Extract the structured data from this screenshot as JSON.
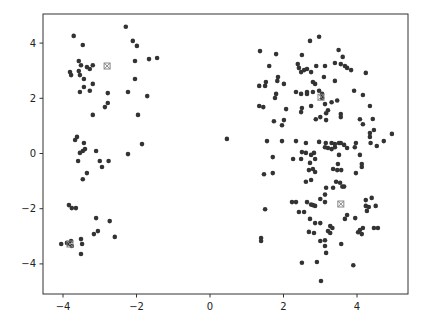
{
  "chart_data": {
    "type": "scatter",
    "title": "",
    "xlabel": "",
    "ylabel": "",
    "xlim": [
      -4.5,
      5.4
    ],
    "ylim": [
      -5.0,
      5.0
    ],
    "xticks": [
      -4,
      -2,
      0,
      2,
      4
    ],
    "yticks": [
      -4,
      -2,
      0,
      2,
      4
    ],
    "xtick_labels": [
      "−4",
      "−2",
      "0",
      "2",
      "4"
    ],
    "ytick_labels": [
      "−4",
      "−2",
      "0",
      "2",
      "4"
    ],
    "grid": false,
    "legend": null,
    "point_color": "#333333",
    "centroid_color": "#888888",
    "series": [
      {
        "name": "points",
        "marker": "circle",
        "points": [
          [
            -3.71,
            4.26
          ],
          [
            -3.46,
            3.93
          ],
          [
            -2.29,
            4.59
          ],
          [
            -2.1,
            4.08
          ],
          [
            -1.99,
            3.9
          ],
          [
            -3.57,
            3.35
          ],
          [
            -3.51,
            3.2
          ],
          [
            -3.35,
            3.13
          ],
          [
            -3.27,
            3.06
          ],
          [
            -3.19,
            3.2
          ],
          [
            -3.81,
            2.95
          ],
          [
            -3.78,
            2.84
          ],
          [
            -3.57,
            2.99
          ],
          [
            -3.54,
            2.84
          ],
          [
            -3.43,
            2.7
          ],
          [
            -3.19,
            2.52
          ],
          [
            -3.43,
            2.41
          ],
          [
            -3.54,
            2.23
          ],
          [
            -3.27,
            2.27
          ],
          [
            -2.04,
            3.35
          ],
          [
            -1.66,
            3.42
          ],
          [
            -1.44,
            3.46
          ],
          [
            -2.04,
            2.7
          ],
          [
            -2.78,
            2.19
          ],
          [
            -2.23,
            2.23
          ],
          [
            -1.71,
            2.08
          ],
          [
            -2.78,
            1.83
          ],
          [
            -2.86,
            1.68
          ],
          [
            -3.19,
            1.4
          ],
          [
            -1.96,
            1.4
          ],
          [
            -3.62,
            0.6
          ],
          [
            -3.67,
            0.49
          ],
          [
            -3.43,
            0.38
          ],
          [
            -3.4,
            0.16
          ],
          [
            -3.46,
            0.09
          ],
          [
            -3.54,
            0.02
          ],
          [
            -3.1,
            0.09
          ],
          [
            -2.23,
            -0.02
          ],
          [
            -1.85,
            0.34
          ],
          [
            -3.59,
            -0.27
          ],
          [
            -3.0,
            -0.27
          ],
          [
            -2.76,
            -0.27
          ],
          [
            -2.94,
            -0.49
          ],
          [
            -3.35,
            -0.71
          ],
          [
            -3.46,
            -0.93
          ],
          [
            -3.84,
            -1.87
          ],
          [
            -3.76,
            -1.98
          ],
          [
            -3.65,
            -1.98
          ],
          [
            -3.1,
            -2.34
          ],
          [
            -2.73,
            -2.45
          ],
          [
            -3.05,
            -2.81
          ],
          [
            -3.16,
            -2.92
          ],
          [
            -2.59,
            -3.02
          ],
          [
            -4.05,
            -3.28
          ],
          [
            -3.89,
            -3.24
          ],
          [
            -3.84,
            -3.28
          ],
          [
            -3.78,
            -3.17
          ],
          [
            -3.76,
            -3.35
          ],
          [
            -3.51,
            -3.1
          ],
          [
            -3.48,
            -3.28
          ],
          [
            -3.51,
            -3.64
          ],
          [
            2.72,
            4.08
          ],
          [
            2.97,
            4.23
          ],
          [
            1.36,
            3.71
          ],
          [
            1.8,
            3.6
          ],
          [
            2.5,
            3.57
          ],
          [
            3.5,
            3.75
          ],
          [
            3.61,
            3.5
          ],
          [
            1.61,
            3.17
          ],
          [
            2.39,
            3.24
          ],
          [
            2.42,
            3.1
          ],
          [
            2.48,
            2.95
          ],
          [
            2.56,
            3.02
          ],
          [
            2.64,
            3.06
          ],
          [
            2.75,
            2.95
          ],
          [
            2.89,
            3.17
          ],
          [
            3.13,
            3.17
          ],
          [
            3.4,
            3.28
          ],
          [
            3.56,
            3.24
          ],
          [
            3.67,
            3.17
          ],
          [
            3.73,
            3.1
          ],
          [
            3.84,
            3.02
          ],
          [
            4.24,
            2.92
          ],
          [
            1.85,
            2.77
          ],
          [
            1.83,
            2.63
          ],
          [
            1.52,
            2.59
          ],
          [
            1.34,
            2.45
          ],
          [
            1.5,
            2.45
          ],
          [
            2.01,
            2.52
          ],
          [
            2.8,
            2.59
          ],
          [
            2.86,
            2.52
          ],
          [
            3.1,
            2.77
          ],
          [
            3.4,
            2.63
          ],
          [
            2.64,
            2.23
          ],
          [
            3.92,
            2.27
          ],
          [
            4.16,
            2.12
          ],
          [
            1.8,
            2.16
          ],
          [
            1.77,
            2.01
          ],
          [
            2.34,
            2.23
          ],
          [
            2.48,
            2.16
          ],
          [
            2.64,
            2.16
          ],
          [
            2.8,
            2.23
          ],
          [
            2.97,
            2.27
          ],
          [
            3.05,
            2.16
          ],
          [
            3.05,
            2.01
          ],
          [
            4.35,
            1.72
          ],
          [
            4.43,
            1.25
          ],
          [
            1.34,
            1.72
          ],
          [
            1.45,
            1.68
          ],
          [
            2.07,
            1.61
          ],
          [
            2.5,
            1.65
          ],
          [
            2.48,
            1.5
          ],
          [
            2.75,
            1.72
          ],
          [
            3.13,
            1.79
          ],
          [
            3.31,
            1.86
          ],
          [
            3.46,
            1.92
          ],
          [
            3.16,
            1.46
          ],
          [
            3.21,
            1.57
          ],
          [
            3.56,
            1.43
          ],
          [
            3.56,
            1.32
          ],
          [
            2.88,
            1.24
          ],
          [
            4.08,
            1.24
          ],
          [
            4.16,
            1.06
          ],
          [
            2.01,
            1.21
          ],
          [
            1.74,
            1.17
          ],
          [
            1.96,
            1.02
          ],
          [
            3.16,
            1.21
          ],
          [
            3.0,
            1.32
          ],
          [
            4.46,
            0.85
          ],
          [
            4.35,
            0.74
          ],
          [
            4.35,
            0.6
          ],
          [
            4.73,
            0.45
          ],
          [
            4.95,
            0.71
          ],
          [
            0.46,
            0.53
          ],
          [
            1.55,
            0.45
          ],
          [
            1.96,
            0.45
          ],
          [
            2.34,
            0.45
          ],
          [
            2.61,
            0.38
          ],
          [
            2.97,
            0.42
          ],
          [
            3.15,
            0.38
          ],
          [
            3.31,
            0.38
          ],
          [
            3.4,
            0.34
          ],
          [
            3.51,
            0.38
          ],
          [
            3.56,
            0.38
          ],
          [
            3.13,
            0.23
          ],
          [
            3.21,
            0.2
          ],
          [
            3.31,
            0.16
          ],
          [
            3.4,
            0.23
          ],
          [
            3.65,
            0.31
          ],
          [
            3.73,
            0.2
          ],
          [
            3.97,
            0.38
          ],
          [
            3.94,
            0.23
          ],
          [
            4.37,
            0.38
          ],
          [
            4.54,
            0.27
          ],
          [
            1.71,
            -0.13
          ],
          [
            2.5,
            0.05
          ],
          [
            2.61,
            0.02
          ],
          [
            2.75,
            -0.05
          ],
          [
            2.83,
            0.02
          ],
          [
            4.08,
            -0.05
          ],
          [
            3.51,
            -0.05
          ],
          [
            1.71,
            -0.71
          ],
          [
            2.26,
            -0.2
          ],
          [
            2.48,
            -0.2
          ],
          [
            2.72,
            -0.34
          ],
          [
            2.86,
            -0.2
          ],
          [
            3.48,
            -0.38
          ],
          [
            4.13,
            -0.38
          ],
          [
            4.13,
            -0.49
          ],
          [
            3.97,
            -0.71
          ],
          [
            2.69,
            -0.6
          ],
          [
            2.8,
            -0.56
          ],
          [
            2.86,
            -0.67
          ],
          [
            3.35,
            -0.56
          ],
          [
            3.46,
            -0.6
          ],
          [
            3.57,
            -0.6
          ],
          [
            2.61,
            -1.02
          ],
          [
            2.75,
            -0.96
          ],
          [
            3.43,
            -1.02
          ],
          [
            3.54,
            -1.06
          ],
          [
            3.65,
            -1.2
          ],
          [
            3.6,
            -1.2
          ],
          [
            3.16,
            -1.24
          ],
          [
            3.35,
            -1.24
          ],
          [
            3.13,
            -1.49
          ],
          [
            1.47,
            -0.75
          ],
          [
            1.5,
            -2.02
          ],
          [
            2.23,
            -1.76
          ],
          [
            2.34,
            -1.76
          ],
          [
            2.64,
            -1.76
          ],
          [
            2.75,
            -1.85
          ],
          [
            2.8,
            -1.87
          ],
          [
            2.86,
            -1.9
          ],
          [
            3.13,
            -1.76
          ],
          [
            3.0,
            -1.65
          ],
          [
            4.24,
            -1.69
          ],
          [
            4.4,
            -1.61
          ],
          [
            4.24,
            -1.9
          ],
          [
            4.32,
            -1.94
          ],
          [
            4.51,
            -1.9
          ],
          [
            4.27,
            -2.08
          ],
          [
            2.42,
            -2.12
          ],
          [
            2.56,
            -2.12
          ],
          [
            3.73,
            -2.23
          ],
          [
            3.67,
            -2.37
          ],
          [
            3.95,
            -2.34
          ],
          [
            2.72,
            -2.37
          ],
          [
            2.86,
            -2.52
          ],
          [
            3.0,
            -2.52
          ],
          [
            3.27,
            -2.63
          ],
          [
            3.33,
            -2.7
          ],
          [
            3.21,
            -2.81
          ],
          [
            3.27,
            -2.88
          ],
          [
            4.16,
            -2.7
          ],
          [
            4.46,
            -2.7
          ],
          [
            4.57,
            -2.7
          ],
          [
            4.08,
            -2.77
          ],
          [
            4.03,
            -2.85
          ],
          [
            4.13,
            -2.92
          ],
          [
            2.69,
            -2.84
          ],
          [
            2.83,
            -2.88
          ],
          [
            3.0,
            -3.17
          ],
          [
            3.13,
            -3.14
          ],
          [
            3.13,
            -3.35
          ],
          [
            3.57,
            -3.28
          ],
          [
            3.16,
            -3.6
          ],
          [
            1.39,
            -3.06
          ],
          [
            1.39,
            -3.17
          ],
          [
            2.5,
            -3.96
          ],
          [
            2.91,
            -3.93
          ],
          [
            3.9,
            -4.05
          ],
          [
            3.02,
            -4.62
          ]
        ]
      },
      {
        "name": "centroids",
        "marker": "x-square",
        "points": [
          [
            -2.8,
            3.17
          ],
          [
            -3.81,
            -3.28
          ],
          [
            3.02,
            2.04
          ],
          [
            3.56,
            -1.83
          ]
        ]
      }
    ]
  }
}
